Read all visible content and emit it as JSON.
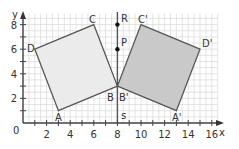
{
  "axes": {
    "x_label": "x",
    "y_label": "y",
    "origin_label": "0",
    "x_ticks": [
      "2",
      "4",
      "6",
      "8",
      "10",
      "12",
      "14",
      "16"
    ],
    "y_ticks": [
      "2",
      "4",
      "6",
      "8"
    ],
    "x_range": [
      0,
      16
    ],
    "y_range": [
      0,
      8
    ]
  },
  "mirror_line": {
    "x": 8,
    "label_top": "R",
    "label_bottom": "s"
  },
  "points": {
    "R": {
      "label": "R",
      "x": 8,
      "y": 8
    },
    "P": {
      "label": "P",
      "x": 8,
      "y": 6
    }
  },
  "original_square": {
    "vertices": [
      {
        "label": "A",
        "x": 3,
        "y": 1
      },
      {
        "label": "B",
        "x": 8,
        "y": 3
      },
      {
        "label": "C",
        "x": 6,
        "y": 8
      },
      {
        "label": "D",
        "x": 1,
        "y": 6
      }
    ],
    "fill": "#ebebeb"
  },
  "reflected_square": {
    "vertices": [
      {
        "label": "A'",
        "x": 13,
        "y": 1
      },
      {
        "label": "B'",
        "x": 8,
        "y": 3
      },
      {
        "label": "C'",
        "x": 10,
        "y": 8
      },
      {
        "label": "D'",
        "x": 15,
        "y": 6
      }
    ],
    "fill": "#c9c9c9"
  },
  "colors": {
    "grid": "#d9d9d9",
    "axis": "#444444",
    "outline": "#555555",
    "point": "#111111"
  }
}
